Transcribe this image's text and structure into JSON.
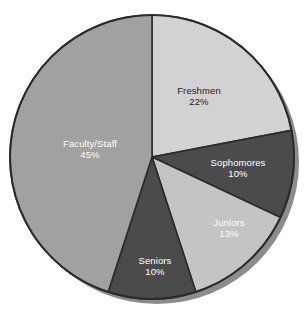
{
  "chart_data": {
    "type": "pie",
    "title": "",
    "subtitle": "",
    "xlabel": "",
    "ylabel": "",
    "legend_position": "none",
    "grid": false,
    "labels_inside_slices": true,
    "categories": [
      "Freshmen",
      "Sophomores",
      "Juniors",
      "Seniors",
      "Faculty/Staff"
    ],
    "values": [
      22,
      10,
      13,
      10,
      45
    ],
    "unit": "%",
    "start_angle_deg": 0,
    "direction": "clockwise",
    "slices": [
      {
        "label": "Freshmen",
        "value": 22,
        "value_text": "22%",
        "color": "#d2d2d2",
        "label_color": "#1d1d1d",
        "start_deg": 0,
        "end_deg": 79.2
      },
      {
        "label": "Sophomores",
        "value": 10,
        "value_text": "10%",
        "color": "#4b4b4b",
        "label_color": "#ffffff",
        "start_deg": 79.2,
        "end_deg": 115.2
      },
      {
        "label": "Juniors",
        "value": 13,
        "value_text": "13%",
        "color": "#c4c4c4",
        "label_color": "#ffffff",
        "start_deg": 115.2,
        "end_deg": 162.0
      },
      {
        "label": "Seniors",
        "value": 10,
        "value_text": "10%",
        "color": "#4b4b4b",
        "label_color": "#ffffff",
        "start_deg": 162.0,
        "end_deg": 198.0
      },
      {
        "label": "Faculty/Staff",
        "value": 45,
        "value_text": "45%",
        "color": "#a1a1a1",
        "label_color": "#ffffff",
        "start_deg": 198.0,
        "end_deg": 360.0
      }
    ],
    "geometry": {
      "center_x": 152,
      "center_y": 157,
      "radius": 142,
      "outline_color": "#2b2b2b",
      "shadow_color": "#8c8c8c",
      "background": "#ffffff"
    },
    "label_positions": [
      {
        "label": "Freshmen",
        "x": 199,
        "y": 96
      },
      {
        "label": "Sophomores",
        "x": 238,
        "y": 168
      },
      {
        "label": "Juniors",
        "x": 229,
        "y": 228
      },
      {
        "label": "Seniors",
        "x": 155,
        "y": 266
      },
      {
        "label": "Faculty/Staff",
        "x": 90,
        "y": 149
      }
    ]
  }
}
